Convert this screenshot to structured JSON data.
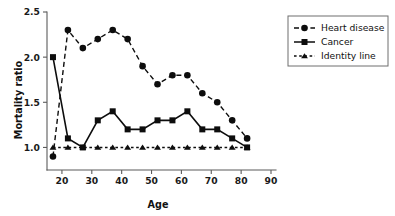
{
  "chart_data": {
    "type": "line",
    "title": "",
    "subtitle": "",
    "xlabel": "Age",
    "ylabel": "Mortality ratio",
    "x": [
      17,
      22,
      27,
      32,
      37,
      42,
      47,
      52,
      57,
      62,
      67,
      72,
      77,
      82
    ],
    "xlim": [
      15,
      90
    ],
    "ylim": [
      0.75,
      2.5
    ],
    "xticks": [
      20,
      30,
      40,
      50,
      60,
      70,
      80,
      90
    ],
    "xtick_labels": [
      "20",
      "30",
      "40",
      "50",
      "60",
      "70",
      "80",
      "90"
    ],
    "yticks": [
      1.0,
      1.5,
      2.0,
      2.5
    ],
    "ytick_labels": [
      "1.0",
      "1.5",
      "2.0",
      "2.5"
    ],
    "grid": false,
    "legend_position": "right",
    "series": [
      {
        "name": "Heart disease",
        "marker": "circle",
        "linestyle": "dashed",
        "color": "#0d0d0d",
        "values": [
          0.9,
          2.3,
          2.1,
          2.2,
          2.3,
          2.2,
          1.9,
          1.7,
          1.8,
          1.8,
          1.6,
          1.5,
          1.3,
          1.1
        ]
      },
      {
        "name": "Cancer",
        "marker": "square",
        "linestyle": "solid",
        "color": "#0d0d0d",
        "values": [
          2.0,
          1.1,
          1.0,
          1.3,
          1.4,
          1.2,
          1.2,
          1.3,
          1.3,
          1.4,
          1.2,
          1.2,
          1.1,
          1.0
        ]
      },
      {
        "name": "Identity line",
        "marker": "triangle",
        "linestyle": "dotted",
        "color": "#0d0d0d",
        "values": [
          1.0,
          1.0,
          1.0,
          1.0,
          1.0,
          1.0,
          1.0,
          1.0,
          1.0,
          1.0,
          1.0,
          1.0,
          1.0,
          1.0
        ]
      }
    ]
  },
  "legend": {
    "items": [
      {
        "label": "Heart disease"
      },
      {
        "label": "Cancer"
      },
      {
        "label": "Identity line"
      }
    ]
  },
  "axes": {
    "x_title": "Age",
    "y_title": "Mortality ratio"
  }
}
